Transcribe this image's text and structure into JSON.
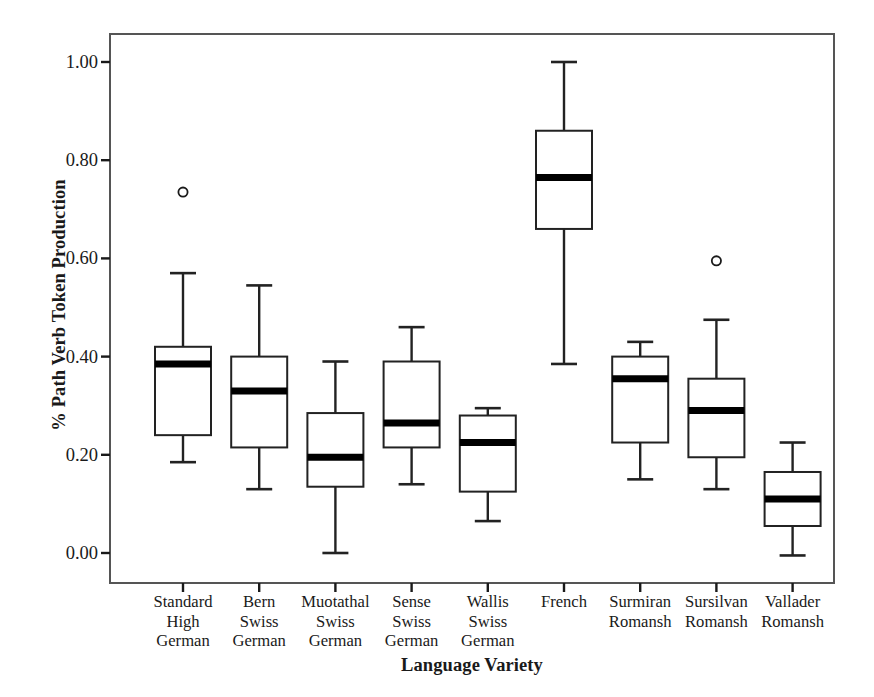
{
  "chart_data": {
    "type": "box",
    "title": "",
    "xlabel": "Language Variety",
    "ylabel": "% Path Verb Token Production",
    "ylim": [
      -0.04,
      1.06
    ],
    "yticks": [
      0.0,
      0.2,
      0.4,
      0.6,
      0.8,
      1.0
    ],
    "ytick_labels": [
      "0.00",
      "0.20",
      "0.40",
      "0.60",
      "0.80",
      "1.00"
    ],
    "grid": false,
    "legend": "none",
    "categories": [
      "Standard\nHigh\nGerman",
      "Bern\nSwiss\nGerman",
      "Muotathal\nSwiss\nGerman",
      "Sense\nSwiss\nGerman",
      "Wallis\nSwiss\nGerman",
      "French",
      "Surmiran\nRomansh",
      "Sursilvan\nRomansh",
      "Vallader\nRomansh"
    ],
    "boxes": [
      {
        "category": "Standard High German",
        "whisker_low": 0.185,
        "q1": 0.24,
        "median": 0.385,
        "q3": 0.42,
        "whisker_high": 0.57,
        "outliers": [
          0.735
        ]
      },
      {
        "category": "Bern Swiss German",
        "whisker_low": 0.13,
        "q1": 0.215,
        "median": 0.33,
        "q3": 0.4,
        "whisker_high": 0.545,
        "outliers": []
      },
      {
        "category": "Muotathal Swiss German",
        "whisker_low": 0.0,
        "q1": 0.135,
        "median": 0.195,
        "q3": 0.285,
        "whisker_high": 0.39,
        "outliers": []
      },
      {
        "category": "Sense Swiss German",
        "whisker_low": 0.14,
        "q1": 0.215,
        "median": 0.265,
        "q3": 0.39,
        "whisker_high": 0.46,
        "outliers": []
      },
      {
        "category": "Wallis Swiss German",
        "whisker_low": 0.065,
        "q1": 0.125,
        "median": 0.225,
        "q3": 0.28,
        "whisker_high": 0.295,
        "outliers": []
      },
      {
        "category": "French",
        "whisker_low": 0.385,
        "q1": 0.66,
        "median": 0.765,
        "q3": 0.86,
        "whisker_high": 1.0,
        "outliers": []
      },
      {
        "category": "Surmiran Romansh",
        "whisker_low": 0.15,
        "q1": 0.225,
        "median": 0.355,
        "q3": 0.4,
        "whisker_high": 0.43,
        "outliers": []
      },
      {
        "category": "Sursilvan Romansh",
        "whisker_low": 0.13,
        "q1": 0.195,
        "median": 0.29,
        "q3": 0.355,
        "whisker_high": 0.475,
        "outliers": [
          0.595
        ]
      },
      {
        "category": "Vallader Romansh",
        "whisker_low": -0.005,
        "q1": 0.055,
        "median": 0.11,
        "q3": 0.165,
        "whisker_high": 0.225,
        "outliers": []
      }
    ],
    "colors": {
      "box_stroke": "#222222",
      "box_fill": "#ffffff",
      "median": "#000000",
      "whisker": "#222222",
      "outlier_stroke": "#1a1a1a",
      "frame": "#555555",
      "text": "#1a1a1a"
    }
  },
  "axis": {
    "ylabel": "% Path Verb Token Production",
    "xlabel": "Language Variety",
    "ytick_labels": [
      "1.00",
      "0.80",
      "0.60",
      "0.40",
      "0.20",
      "0.00"
    ]
  },
  "xtick_labels": [
    [
      "Standard",
      "High",
      "German"
    ],
    [
      "Bern",
      "Swiss",
      "German"
    ],
    [
      "Muotathal",
      "Swiss",
      "German"
    ],
    [
      "Sense",
      "Swiss",
      "German"
    ],
    [
      "Wallis",
      "Swiss",
      "German"
    ],
    [
      "French"
    ],
    [
      "Surmiran",
      "Romansh"
    ],
    [
      "Sursilvan",
      "Romansh"
    ],
    [
      "Vallader",
      "Romansh"
    ]
  ]
}
